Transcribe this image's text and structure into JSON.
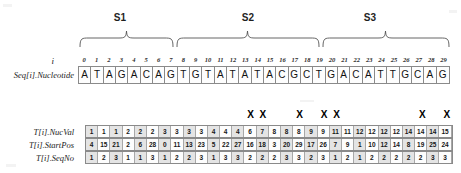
{
  "figure": {
    "segments": [
      {
        "name": "S1",
        "start_index": 0,
        "end_index": 7
      },
      {
        "name": "S2",
        "start_index": 8,
        "end_index": 19
      },
      {
        "name": "S3",
        "start_index": 20,
        "end_index": 29
      }
    ],
    "index_row": {
      "label": "i",
      "indices": [
        0,
        1,
        2,
        3,
        4,
        5,
        6,
        7,
        8,
        9,
        10,
        11,
        12,
        13,
        14,
        15,
        16,
        17,
        18,
        19,
        20,
        21,
        22,
        23,
        24,
        25,
        26,
        27,
        28,
        29
      ]
    },
    "sequence_row": {
      "label": "Seq[i].Nucleotide",
      "nucleotides": [
        "A",
        "T",
        "A",
        "G",
        "A",
        "C",
        "A",
        "G",
        "T",
        "G",
        "T",
        "A",
        "T",
        "A",
        "T",
        "A",
        "C",
        "G",
        "C",
        "T",
        "G",
        "A",
        "C",
        "A",
        "T",
        "T",
        "G",
        "C",
        "A",
        "G"
      ]
    },
    "table": {
      "rows": [
        {
          "label": "T[i].NucVal",
          "values": [
            1,
            1,
            1,
            2,
            2,
            2,
            3,
            3,
            3,
            3,
            4,
            4,
            4,
            6,
            7,
            8,
            8,
            8,
            9,
            9,
            11,
            11,
            12,
            12,
            12,
            12,
            14,
            14,
            14,
            15
          ]
        },
        {
          "label": "T[i].StartPos",
          "values": [
            4,
            15,
            21,
            2,
            6,
            28,
            0,
            11,
            13,
            23,
            5,
            22,
            27,
            16,
            18,
            3,
            20,
            29,
            17,
            26,
            7,
            9,
            1,
            10,
            12,
            14,
            8,
            19,
            25,
            24
          ]
        },
        {
          "label": "T[i].SeqNo",
          "values": [
            1,
            2,
            3,
            1,
            1,
            3,
            1,
            2,
            2,
            3,
            1,
            3,
            3,
            2,
            2,
            2,
            3,
            3,
            2,
            3,
            1,
            2,
            1,
            2,
            2,
            2,
            2,
            2,
            3,
            3
          ]
        }
      ],
      "marker_glyph": "X",
      "marked_columns": [
        13,
        14,
        17,
        19,
        20,
        27,
        29
      ]
    },
    "colors": {
      "grid_line": "#8a8a8a",
      "shade_cell": "#e4e4e4",
      "text": "#111111",
      "background": "#ffffff"
    }
  }
}
